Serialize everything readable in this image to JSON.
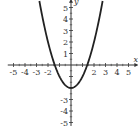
{
  "chart_data": {
    "type": "line",
    "title": "",
    "xlabel": "x",
    "ylabel": "y",
    "xlim": [
      -5,
      5
    ],
    "ylim": [
      -5,
      5
    ],
    "grid": false,
    "function": "y = x^2 - 2",
    "x_ticks": [
      "-5",
      "-4",
      "-3",
      "-2",
      "2",
      "3",
      "4",
      "5"
    ],
    "y_ticks": [
      "5",
      "4",
      "3",
      "2",
      "1",
      "-3",
      "-4",
      "-5"
    ],
    "series": [
      {
        "name": "parabola",
        "x": [
          -2.7,
          -2.5,
          -2,
          -1.5,
          -1.414,
          -1,
          -0.5,
          0,
          0.5,
          1,
          1.414,
          1.5,
          2,
          2.5,
          2.7
        ],
        "values": [
          5.29,
          4.25,
          2,
          0.25,
          0,
          -1,
          -1.75,
          -2,
          -1.75,
          -1,
          0,
          0.25,
          2,
          4.25,
          5.29
        ]
      }
    ],
    "vertex": [
      0,
      -2
    ]
  },
  "colors": {
    "curve": "#222222",
    "axes": "#333333"
  }
}
